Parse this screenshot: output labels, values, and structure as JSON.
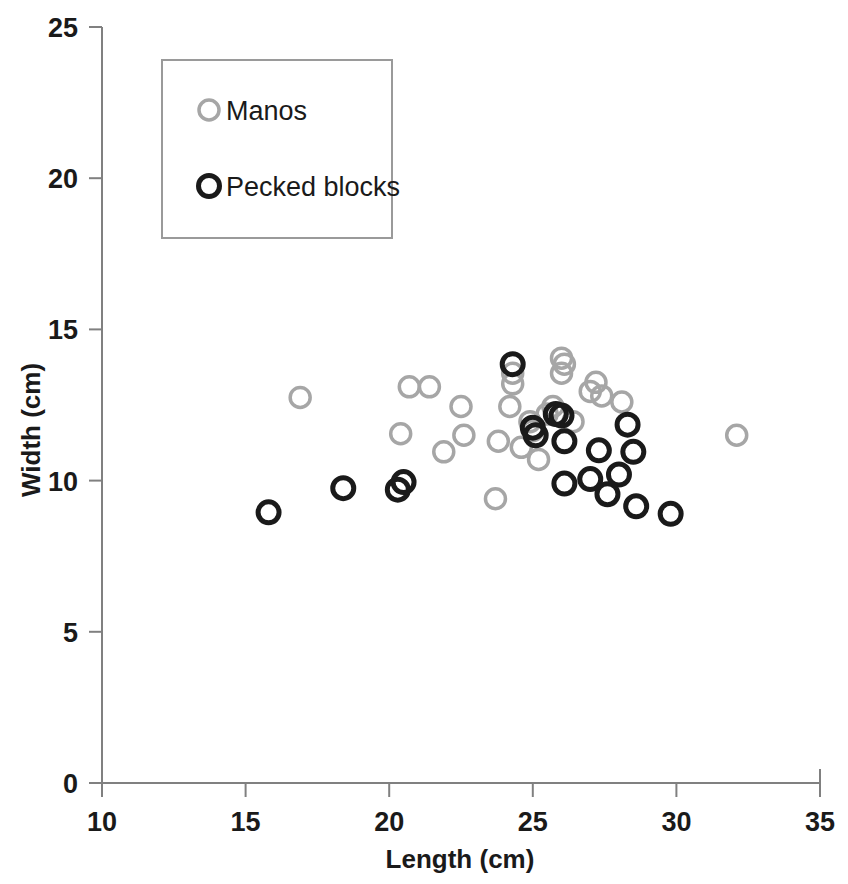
{
  "chart_data": {
    "type": "scatter",
    "title": "",
    "xlabel": "Length (cm)",
    "ylabel": "Width (cm)",
    "xlim": [
      10,
      35
    ],
    "ylim": [
      0,
      25
    ],
    "xticks": [
      "10",
      "15",
      "20",
      "25",
      "30",
      "35"
    ],
    "xtick_values": [
      10,
      15,
      20,
      25,
      30,
      35
    ],
    "yticks": [
      "0",
      "5",
      "10",
      "15",
      "20",
      "25"
    ],
    "ytick_values": [
      0,
      5,
      10,
      15,
      20,
      25
    ],
    "grid": false,
    "legend_position": "top-left-inside",
    "marker": "open-circle",
    "series": [
      {
        "name": "Manos",
        "color": "#a6a6a6",
        "points": [
          [
            16.9,
            12.75
          ],
          [
            20.7,
            13.1
          ],
          [
            21.4,
            13.1
          ],
          [
            20.4,
            11.55
          ],
          [
            21.9,
            10.95
          ],
          [
            22.5,
            12.45
          ],
          [
            22.6,
            11.5
          ],
          [
            23.7,
            9.4
          ],
          [
            23.8,
            11.3
          ],
          [
            24.2,
            12.45
          ],
          [
            24.3,
            13.55
          ],
          [
            24.3,
            13.2
          ],
          [
            24.6,
            11.1
          ],
          [
            24.9,
            11.95
          ],
          [
            25.0,
            11.65
          ],
          [
            25.2,
            10.7
          ],
          [
            25.5,
            12.2
          ],
          [
            25.7,
            12.45
          ],
          [
            26.0,
            14.05
          ],
          [
            26.0,
            13.55
          ],
          [
            26.1,
            13.85
          ],
          [
            26.4,
            11.95
          ],
          [
            27.0,
            12.95
          ],
          [
            27.2,
            13.25
          ],
          [
            27.4,
            12.8
          ],
          [
            28.1,
            12.6
          ],
          [
            32.1,
            11.5
          ]
        ]
      },
      {
        "name": "Pecked blocks",
        "color": "#1a1a1a",
        "points": [
          [
            15.8,
            8.95
          ],
          [
            18.4,
            9.75
          ],
          [
            20.3,
            9.7
          ],
          [
            20.5,
            9.95
          ],
          [
            24.3,
            13.85
          ],
          [
            25.0,
            11.75
          ],
          [
            25.1,
            11.5
          ],
          [
            25.8,
            12.2
          ],
          [
            26.0,
            12.15
          ],
          [
            26.1,
            11.3
          ],
          [
            26.1,
            9.9
          ],
          [
            27.0,
            10.05
          ],
          [
            27.3,
            11.0
          ],
          [
            27.6,
            9.55
          ],
          [
            28.0,
            10.2
          ],
          [
            28.3,
            11.85
          ],
          [
            28.5,
            10.95
          ],
          [
            28.6,
            9.15
          ],
          [
            29.8,
            8.9
          ]
        ]
      }
    ]
  },
  "legend": {
    "items": [
      {
        "label": "Manos",
        "color": "#a6a6a6"
      },
      {
        "label": "Pecked blocks",
        "color": "#1a1a1a"
      }
    ]
  },
  "axes": {
    "x_title": "Length (cm)",
    "y_title": "Width (cm)"
  }
}
